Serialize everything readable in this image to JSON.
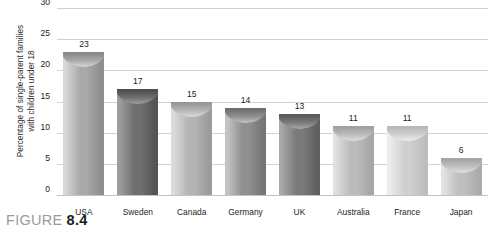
{
  "caption": {
    "word": "FIGURE",
    "number": "8.4"
  },
  "chart_data": {
    "type": "bar",
    "title": "",
    "xlabel": "",
    "ylabel": "Percentage of single-parent families with children under 18",
    "ylabel_line1": "Percentage of single-parent families",
    "ylabel_line2": "with children under 18",
    "categories": [
      "USA",
      "Sweden",
      "Canada",
      "Germany",
      "UK",
      "Australia",
      "France",
      "Japan"
    ],
    "values": [
      23,
      17,
      15,
      14,
      13,
      11,
      11,
      6
    ],
    "value_labels": [
      "23",
      "17",
      "15",
      "14",
      "13",
      "11",
      "11",
      "6"
    ],
    "ylim": [
      0,
      30
    ],
    "yticks": [
      30,
      25,
      20,
      15,
      10,
      5,
      0
    ],
    "ytick_labels": [
      "30",
      "25",
      "20",
      "15",
      "10",
      "5",
      "0"
    ],
    "grid": true,
    "grid_axis": "y",
    "legend": false,
    "bar_style": "cylinder",
    "bar_colors": [
      {
        "category": "USA",
        "light": "#d8d8d8",
        "mid": "#a9a9a9",
        "dark": "#8e8e8e",
        "cap": "#8a8a8a"
      },
      {
        "category": "Sweden",
        "light": "#9e9e9e",
        "mid": "#6f6f6f",
        "dark": "#555555",
        "cap": "#4f4f4f"
      },
      {
        "category": "Canada",
        "light": "#dcdcdc",
        "mid": "#b4b4b4",
        "dark": "#9c9c9c",
        "cap": "#979797"
      },
      {
        "category": "Germany",
        "light": "#c4c4c4",
        "mid": "#8f8f8f",
        "dark": "#767676",
        "cap": "#6f6f6f"
      },
      {
        "category": "UK",
        "light": "#a8a8a8",
        "mid": "#7a7a7a",
        "dark": "#606060",
        "cap": "#5a5a5a"
      },
      {
        "category": "Australia",
        "light": "#e0e0e0",
        "mid": "#bcbcbc",
        "dark": "#a6a6a6",
        "cap": "#a1a1a1"
      },
      {
        "category": "France",
        "light": "#ededed",
        "mid": "#cfcfcf",
        "dark": "#bdbdbd",
        "cap": "#b8b8b8"
      },
      {
        "category": "Japan",
        "light": "#e2e2e2",
        "mid": "#bfbfbf",
        "dark": "#ababab",
        "cap": "#a6a6a6"
      }
    ],
    "colors": {
      "gridline": "#d2d2d2",
      "baseline": "#c2c2c2",
      "text": "#1d1d1d",
      "background": "#ffffff"
    }
  }
}
